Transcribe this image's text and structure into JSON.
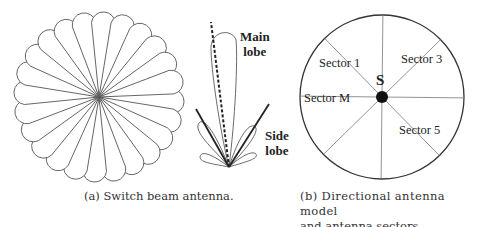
{
  "figure_a": {
    "caption": "(a) Switch beam antenna.",
    "beam_count": 24
  },
  "figure_middle": {
    "main_lobe_line1": "Main",
    "main_lobe_line2": "lobe",
    "side_lobe_line1": "Side",
    "side_lobe_line2": "lobe"
  },
  "figure_b": {
    "caption_line1": "(b) Directional antenna model",
    "caption_line2": "and antenna sectors.",
    "center_label": "S",
    "sectors": [
      "Sector 1",
      "Sector 3",
      "Sector M",
      "Sector 5"
    ],
    "sector_count": 8
  }
}
